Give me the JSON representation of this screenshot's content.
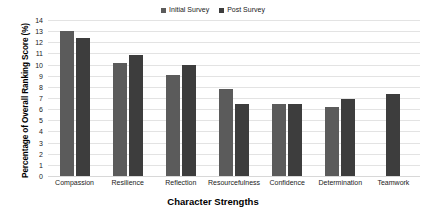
{
  "chart_data": {
    "type": "bar",
    "title": "",
    "xlabel": "Character Strengths",
    "ylabel": "Percentage of Overall Ranking Score (%)",
    "categories": [
      "Compassion",
      "Resilience",
      "Reflection",
      "Resourcefulness",
      "Confidence",
      "Determination",
      "Teamwork"
    ],
    "series": [
      {
        "name": "Initial Survey",
        "color": "#5b5b5b",
        "values": [
          13.05,
          10.15,
          9.05,
          7.85,
          6.45,
          6.2,
          null
        ]
      },
      {
        "name": "Post Survey",
        "color": "#3d3d3d",
        "values": [
          12.35,
          10.85,
          9.95,
          6.45,
          6.45,
          6.9,
          7.4
        ]
      }
    ],
    "ylim": [
      0,
      14
    ],
    "ytick_step": 1,
    "yticks": [
      "14",
      "13",
      "12",
      "11",
      "10",
      "9",
      "8",
      "7",
      "6",
      "5",
      "4",
      "3",
      "2",
      "1",
      "0"
    ],
    "grid": true,
    "legend_position": "top-center"
  },
  "legend": {
    "entries": [
      {
        "label": "Initial Survey",
        "color": "#5b5b5b"
      },
      {
        "label": "Post Survey",
        "color": "#3d3d3d"
      }
    ]
  }
}
